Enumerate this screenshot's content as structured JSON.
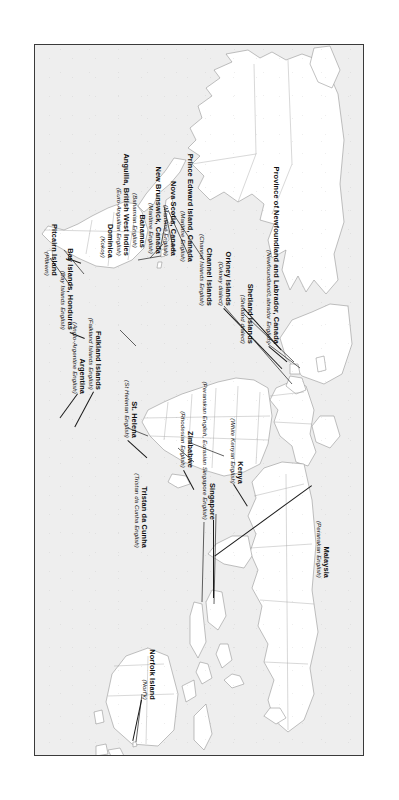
{
  "figure": {
    "type": "map",
    "title": "",
    "projection": "world-equirectangular",
    "background_color": "#eeeeee",
    "border_color": "#3a3a3a",
    "land_fill": "#ffffff",
    "coastline_color": "#808080",
    "border_line_color": "#9a9a9a",
    "label_color": "#0d0d0d",
    "orientation": "rotated-90-clockwise"
  },
  "labels": [
    {
      "id": "newfoundland-labrador",
      "name": "Province of Newfoundland and Labrador, Canada",
      "variety": "(Newfoundland/Labrador English)"
    },
    {
      "id": "shetland-islands",
      "name": "Shetland Islands",
      "variety": "(Shetland dialect)"
    },
    {
      "id": "orkney-islands",
      "name": "Orkney Islands",
      "variety": "(Orkney dialect)"
    },
    {
      "id": "channel-islands",
      "name": "Channel Islands",
      "variety": "(Channel Islands English)"
    },
    {
      "id": "prince-edward-island",
      "name": "Prince Edward Island, Canada",
      "variety": "(Maritime English)"
    },
    {
      "id": "nova-scotia",
      "name": "Nova Scotia, Canada",
      "variety": "(Maritime English)"
    },
    {
      "id": "new-brunswick",
      "name": "New Brunswick, Canada",
      "variety": "(Maritime English)"
    },
    {
      "id": "bahamas",
      "name": "Bahamas",
      "variety": "(Bahamian English)"
    },
    {
      "id": "anguilla",
      "name": "Anguilla, British West Indies",
      "variety": "(Euro-Anguillan English)"
    },
    {
      "id": "dominica",
      "name": "Dominica",
      "variety": "(Kokoy)"
    },
    {
      "id": "bay-islands",
      "name": "Bay Islands, Honduras",
      "variety": "(Bay Islands English)"
    },
    {
      "id": "pitcairn-island",
      "name": "Pitcairn Island",
      "variety": "(Pitkern)"
    },
    {
      "id": "st-helena",
      "name": "St. Helena",
      "variety": "(St Helenan English)"
    },
    {
      "id": "tristan-da-cunha",
      "name": "Tristan da Cunha",
      "variety": "(Tristan da Cunha English)"
    },
    {
      "id": "falkland-islands",
      "name": "Falkland Islands",
      "variety": "(Falkland Islands English)"
    },
    {
      "id": "argentina",
      "name": "Argentina",
      "variety": "(Anglo-Argentine English)"
    },
    {
      "id": "zimbabwe",
      "name": "Zimbabwe",
      "variety": "(Rhodesian English)"
    },
    {
      "id": "kenya",
      "name": "Kenya",
      "variety": "(White Kenyan English)"
    },
    {
      "id": "singapore",
      "name": "Singapore",
      "variety": "(Peranakan English, Eurasian Singapore English)"
    },
    {
      "id": "malaysia",
      "name": "Malaysia",
      "variety": "(Peranakan English)"
    },
    {
      "id": "norfolk-island",
      "name": "Norfolk Island",
      "variety": "(Norf'k)"
    }
  ]
}
